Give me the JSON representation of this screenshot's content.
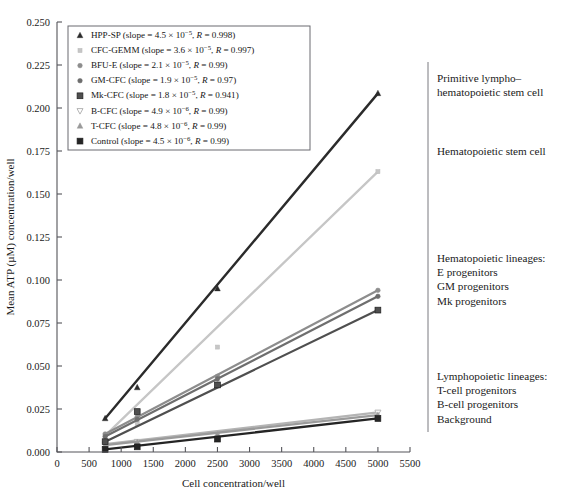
{
  "axes": {
    "ylabel": "Mean ATP (µM) concentration/well",
    "xlabel": "Cell concentration/well",
    "yticks": [
      "0.000",
      "0.025",
      "0.050",
      "0.075",
      "0.100",
      "0.125",
      "0.150",
      "0.175",
      "0.200",
      "0.225",
      "0.250"
    ],
    "xticks": [
      "0",
      "500",
      "1000",
      "1500",
      "2000",
      "2500",
      "3000",
      "3500",
      "4000",
      "4500",
      "5000",
      "5500"
    ]
  },
  "legend": {
    "entries": [
      {
        "marker": "triangle-up",
        "label": "HPP-SP",
        "slope_mantissa": "4.5",
        "slope_exp": "−5",
        "r": "0.998",
        "color": "#2b2b2b"
      },
      {
        "marker": "small-square-light",
        "label": "CFC-GEMM",
        "slope_mantissa": "3.6",
        "slope_exp": "−5",
        "r": "0.997",
        "color": "#c6c6c6"
      },
      {
        "marker": "dot",
        "label": "BFU-E",
        "slope_mantissa": "2.1",
        "slope_exp": "−5",
        "r": "0.99",
        "color": "#8d8d8d"
      },
      {
        "marker": "dot-dark",
        "label": "GM-CFC",
        "slope_mantissa": "1.9",
        "slope_exp": "−5",
        "r": "0.97",
        "color": "#6e6e6e"
      },
      {
        "marker": "square",
        "label": "Mk-CFC",
        "slope_mantissa": "1.8",
        "slope_exp": "−5",
        "r": "0.941",
        "color": "#4f4f4f"
      },
      {
        "marker": "triangle-down-open",
        "label": "B-CFC",
        "slope_mantissa": "4.9",
        "slope_exp": "−6",
        "r": "0.99",
        "color": "#b4b4b4"
      },
      {
        "marker": "triangle-up-light",
        "label": "T-CFC",
        "slope_mantissa": "4.8",
        "slope_exp": "−6",
        "r": "0.99",
        "color": "#9a9a9a"
      },
      {
        "marker": "square-dark",
        "label": "Control",
        "slope_mantissa": "4.5",
        "slope_exp": "−6",
        "r": "0.99",
        "color": "#252525"
      }
    ],
    "slope_prefix": "slope = ",
    "times": "×",
    "ten": "10",
    "r_prefix": "R = "
  },
  "annotations": [
    {
      "lines": [
        "Primitive lympho–",
        "hematopoietic stem cell"
      ],
      "y": 82
    },
    {
      "lines": [
        "Hematopoietic stem cell"
      ],
      "y": 155
    },
    {
      "lines": [
        "Hematopoietic lineages:",
        "E progenitors",
        "GM progenitors",
        "Mk progenitors"
      ],
      "y": 262
    },
    {
      "lines": [
        "Lymphopoietic lineages:",
        "T-cell progenitors",
        "B-cell progenitors",
        "Background"
      ],
      "y": 380
    }
  ],
  "chart_data": {
    "type": "line",
    "title": "",
    "xlabel": "Cell concentration/well",
    "ylabel": "Mean ATP (µM) concentration/well",
    "xlim": [
      0,
      5500
    ],
    "ylim": [
      0.0,
      0.25
    ],
    "xticks": [
      0,
      500,
      1000,
      1500,
      2000,
      2500,
      3000,
      3500,
      4000,
      4500,
      5000,
      5500
    ],
    "yticks": [
      0.0,
      0.025,
      0.05,
      0.075,
      0.1,
      0.125,
      0.15,
      0.175,
      0.2,
      0.225,
      0.25
    ],
    "grid": false,
    "legend_position": "upper-left",
    "x": [
      750,
      1250,
      2500,
      5000
    ],
    "series": [
      {
        "name": "HPP-SP",
        "slope": 4.5e-05,
        "R": 0.998,
        "color": "#2b2b2b",
        "marker": "triangle-up",
        "values": [
          0.0195,
          0.0375,
          0.095,
          0.2085
        ]
      },
      {
        "name": "CFC-GEMM",
        "slope": 3.6e-05,
        "R": 0.997,
        "color": "#c6c6c6",
        "marker": "small-square-light",
        "values": [
          0.0095,
          0.0165,
          0.061,
          0.163
        ]
      },
      {
        "name": "BFU-E",
        "slope": 2.1e-05,
        "R": 0.99,
        "color": "#8d8d8d",
        "marker": "dot",
        "values": [
          0.0105,
          0.0205,
          0.044,
          0.094
        ]
      },
      {
        "name": "GM-CFC",
        "slope": 1.9e-05,
        "R": 0.97,
        "color": "#6e6e6e",
        "marker": "dot-dark",
        "values": [
          0.009,
          0.019,
          0.0425,
          0.0905
        ]
      },
      {
        "name": "Mk-CFC",
        "slope": 1.8e-05,
        "R": 0.941,
        "color": "#4f4f4f",
        "marker": "square",
        "values": [
          0.006,
          0.0235,
          0.039,
          0.0825
        ]
      },
      {
        "name": "B-CFC",
        "slope": 4.9e-06,
        "R": 0.99,
        "color": "#b4b4b4",
        "marker": "triangle-down-open",
        "values": [
          0.0045,
          0.006,
          0.0105,
          0.023
        ]
      },
      {
        "name": "T-CFC",
        "slope": 4.8e-06,
        "R": 0.99,
        "color": "#9a9a9a",
        "marker": "triangle-up-light",
        "values": [
          0.004,
          0.0055,
          0.01,
          0.0215
        ]
      },
      {
        "name": "Control",
        "slope": 4.5e-06,
        "R": 0.99,
        "color": "#252525",
        "marker": "square-dark",
        "values": [
          0.0015,
          0.003,
          0.0075,
          0.0195
        ]
      }
    ]
  }
}
